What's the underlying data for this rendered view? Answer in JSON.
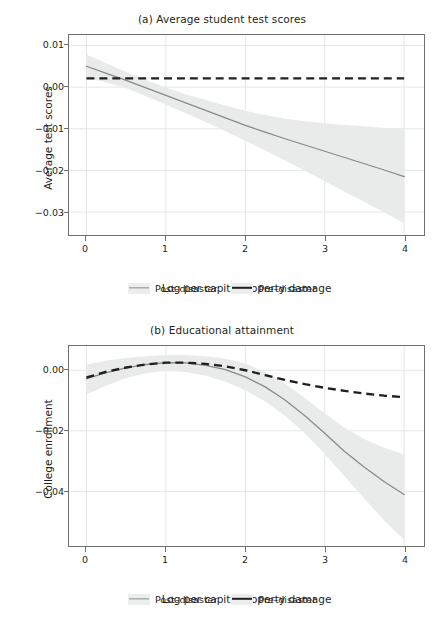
{
  "figure": {
    "legend": {
      "post_label": "Post–disaster",
      "pre_label": "Pre–disaster"
    },
    "colors": {
      "band": "#e9eaea",
      "post_line": "#8a8a8a",
      "pre_line": "#231f20",
      "grid": "#e3e6e8",
      "frame": "#6f6f6f",
      "text": "#231f20"
    }
  },
  "chart_data": [
    {
      "type": "line",
      "panel": "a",
      "title": "(a) Average student test scores",
      "xlabel": "Log per capita property damage",
      "ylabel": "Average test scores",
      "xlim": [
        -0.22,
        4.25
      ],
      "ylim": [
        -0.0355,
        0.0125
      ],
      "xticks": [
        0,
        1,
        2,
        3,
        4
      ],
      "xticklabels": [
        "0",
        "1",
        "2",
        "3",
        "4"
      ],
      "yticks": [
        0.01,
        0.0,
        -0.01,
        -0.02,
        -0.03
      ],
      "yticklabels": [
        "0.01",
        "0.00",
        "−0.01",
        "−0.02",
        "−0.03"
      ],
      "grid": true,
      "legend_position": "below",
      "x": [
        0,
        0.25,
        0.5,
        0.75,
        1.0,
        1.25,
        1.5,
        1.75,
        2.0,
        2.25,
        2.5,
        2.75,
        3.0,
        3.25,
        3.5,
        3.75,
        4.0
      ],
      "series": [
        {
          "name": "Post–disaster",
          "style": "solid",
          "color": "#8a8a8a",
          "values": [
            0.005,
            0.0033,
            0.0016,
            -0.0002,
            -0.002,
            -0.0038,
            -0.0056,
            -0.0074,
            -0.0092,
            -0.0108,
            -0.0124,
            -0.0139,
            -0.0154,
            -0.0169,
            -0.0184,
            -0.0199,
            -0.0215
          ],
          "ci_lower": [
            0.0023,
            0.0011,
            -0.0003,
            -0.0022,
            -0.0042,
            -0.0063,
            -0.0084,
            -0.0106,
            -0.0129,
            -0.0152,
            -0.0176,
            -0.0201,
            -0.0226,
            -0.0251,
            -0.0276,
            -0.0301,
            -0.0327
          ],
          "ci_upper": [
            0.0078,
            0.0057,
            0.0036,
            0.0017,
            -0.0001,
            -0.0017,
            -0.0031,
            -0.0044,
            -0.0057,
            -0.0067,
            -0.0076,
            -0.0082,
            -0.0087,
            -0.0091,
            -0.0094,
            -0.0098,
            -0.0102
          ]
        },
        {
          "name": "Pre–disaster",
          "style": "dashed",
          "color": "#231f20",
          "values": [
            0.0021,
            0.0021,
            0.0021,
            0.0021,
            0.0021,
            0.0021,
            0.0021,
            0.0021,
            0.0021,
            0.0021,
            0.0021,
            0.0021,
            0.0021,
            0.0021,
            0.0021,
            0.0021,
            0.0021
          ]
        }
      ]
    },
    {
      "type": "line",
      "panel": "b",
      "title": "(b) Educational attainment",
      "xlabel": "Log per capita property damage",
      "ylabel": "College enrollment",
      "xlim": [
        -0.22,
        4.25
      ],
      "ylim": [
        -0.058,
        0.008
      ],
      "xticks": [
        0,
        1,
        2,
        3,
        4
      ],
      "xticklabels": [
        "0",
        "1",
        "2",
        "3",
        "4"
      ],
      "yticks": [
        0.0,
        -0.02,
        -0.04
      ],
      "yticklabels": [
        "0.00",
        "−0.02",
        "−0.04"
      ],
      "grid": true,
      "legend_position": "below",
      "x": [
        0,
        0.25,
        0.5,
        0.75,
        1.0,
        1.25,
        1.5,
        1.75,
        2.0,
        2.25,
        2.5,
        2.75,
        3.0,
        3.25,
        3.5,
        3.75,
        4.0
      ],
      "series": [
        {
          "name": "Post–disaster",
          "style": "solid",
          "color": "#8a8a8a",
          "values": [
            -0.0028,
            -0.0008,
            0.0008,
            0.0019,
            0.0025,
            0.0024,
            0.0016,
            0.0002,
            -0.0022,
            -0.0055,
            -0.0098,
            -0.015,
            -0.0208,
            -0.0268,
            -0.032,
            -0.0368,
            -0.041
          ],
          "ci_lower": [
            -0.008,
            -0.005,
            -0.0026,
            -0.001,
            -0.0002,
            -0.0006,
            -0.0018,
            -0.0038,
            -0.0066,
            -0.0103,
            -0.015,
            -0.0208,
            -0.0276,
            -0.035,
            -0.0424,
            -0.0496,
            -0.056
          ],
          "ci_upper": [
            0.0018,
            0.0032,
            0.004,
            0.0046,
            0.005,
            0.005,
            0.0046,
            0.0038,
            0.0022,
            -0.0006,
            -0.0044,
            -0.0092,
            -0.0142,
            -0.019,
            -0.0228,
            -0.0256,
            -0.0278
          ]
        },
        {
          "name": "Pre–disaster",
          "style": "dashed",
          "color": "#231f20",
          "values": [
            -0.0024,
            -0.0005,
            0.0009,
            0.0019,
            0.0025,
            0.0025,
            0.0021,
            0.0013,
            0.0,
            -0.0016,
            -0.0032,
            -0.0046,
            -0.0058,
            -0.0068,
            -0.0077,
            -0.0084,
            -0.0089
          ]
        }
      ]
    }
  ]
}
